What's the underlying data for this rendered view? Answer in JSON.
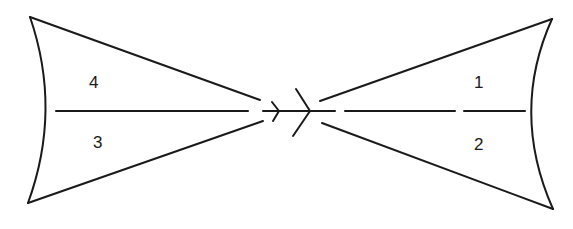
{
  "diagram": {
    "type": "symmetric-wedge-diagram",
    "regions": [
      {
        "id": "1",
        "label": "1",
        "side": "right",
        "position": "upper"
      },
      {
        "id": "2",
        "label": "2",
        "side": "right",
        "position": "lower"
      },
      {
        "id": "3",
        "label": "3",
        "side": "left",
        "position": "lower"
      },
      {
        "id": "4",
        "label": "4",
        "side": "left",
        "position": "upper"
      }
    ],
    "center_symbols": [
      "small-arrowhead-right",
      "large-chevron-right"
    ],
    "colors": {
      "stroke": "#1a1a1a",
      "background": "#ffffff"
    }
  }
}
